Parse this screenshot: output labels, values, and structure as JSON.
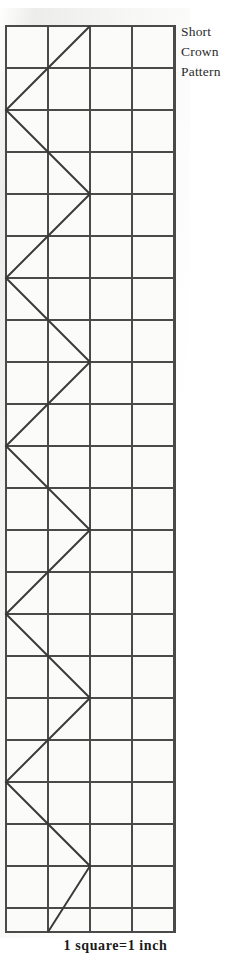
{
  "figure": {
    "title_lines": [
      "Short",
      "Crown",
      "Pattern"
    ],
    "caption": "1 square=1 inch",
    "colors": {
      "background": "#ffffff",
      "grid_line": "#4a4a4a",
      "pattern_line": "#3a3a3a",
      "paper_shade": "#ebebe9",
      "text": "#2b2b2b"
    },
    "grid": {
      "origin_x": 6,
      "origin_y": 26,
      "cell_px": 42,
      "columns": 4,
      "rows": 21.6,
      "width_px": 169,
      "height_px": 906,
      "unit_label": "1 square=1 inch"
    },
    "pattern_line_points": [
      [
        90,
        26
      ],
      [
        6,
        110
      ],
      [
        90,
        194
      ],
      [
        6,
        278
      ],
      [
        90,
        362
      ],
      [
        6,
        446
      ],
      [
        90,
        530
      ],
      [
        6,
        614
      ],
      [
        90,
        698
      ],
      [
        6,
        782
      ],
      [
        90,
        866
      ],
      [
        48,
        932
      ]
    ]
  },
  "chart_data": {
    "type": "line",
    "title": "Short Crown Pattern",
    "subtitle": "1 square=1 inch",
    "xlabel": "inches (1 square = 1 inch)",
    "ylabel": "inches (1 square = 1 inch)",
    "xlim": [
      0,
      4
    ],
    "ylim": [
      0,
      21.6
    ],
    "grid": true,
    "legend": "none",
    "series": [
      {
        "name": "crown zigzag cut line",
        "x": [
          2,
          0,
          2,
          0,
          2,
          0,
          2,
          0,
          2,
          0,
          2,
          1
        ],
        "y": [
          0,
          2,
          4,
          6,
          8,
          10,
          12,
          14,
          16,
          18,
          20,
          21.6
        ]
      }
    ]
  }
}
